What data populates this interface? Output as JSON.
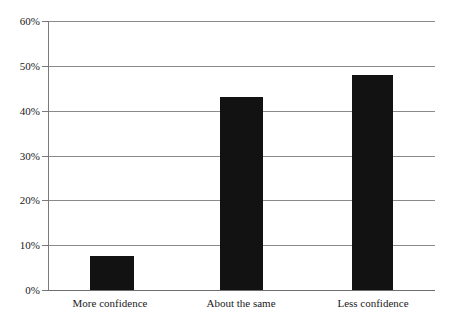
{
  "chart_data": {
    "type": "bar",
    "title": "",
    "subtitle": "",
    "xlabel": "",
    "ylabel": "",
    "categories": [
      "More confidence",
      "About the same",
      "Less confidence"
    ],
    "values": [
      7.5,
      43,
      48
    ],
    "value_labels": [
      "",
      "",
      ""
    ],
    "ylim": [
      0,
      60
    ],
    "ytick_values": [
      0,
      10,
      20,
      30,
      40,
      50,
      60
    ],
    "ytick_labels": [
      "0%",
      "10%",
      "20%",
      "30%",
      "40%",
      "50%",
      "60%"
    ],
    "grid": true,
    "legend": false,
    "legend_position": "none",
    "bar_color": "#121212",
    "gridline_color": "#8a8a8a",
    "axis_color": "#7a7a7a",
    "background_color": "#ffffff",
    "text_color": "#1a1a1a"
  }
}
